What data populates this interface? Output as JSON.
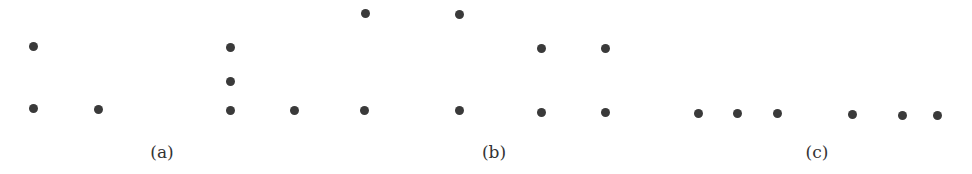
{
  "figure": {
    "dot_color": "#3a3a3a",
    "background": "#ffffff",
    "panels": [
      {
        "id": "a",
        "caption": "(a)",
        "caption_x": 162,
        "groups": [
          {
            "name": "left-configuration",
            "points": [
              [
                33,
                46
              ],
              [
                33,
                108
              ],
              [
                98,
                109
              ]
            ]
          },
          {
            "name": "right-configuration",
            "points": [
              [
                230,
                47
              ],
              [
                230,
                81
              ],
              [
                230,
                110
              ],
              [
                294,
                110
              ]
            ]
          }
        ]
      },
      {
        "id": "b",
        "caption": "(b)",
        "caption_x": 494,
        "groups": [
          {
            "name": "large-square",
            "points": [
              [
                365,
                13
              ],
              [
                459,
                14
              ],
              [
                364,
                110
              ],
              [
                459,
                110
              ]
            ]
          },
          {
            "name": "small-square",
            "points": [
              [
                541,
                48
              ],
              [
                605,
                48
              ],
              [
                541,
                112
              ],
              [
                605,
                112
              ]
            ]
          }
        ]
      },
      {
        "id": "c",
        "caption": "(c)",
        "caption_x": 817,
        "groups": [
          {
            "name": "collinear-points",
            "points": [
              [
                698,
                113
              ],
              [
                737,
                113
              ],
              [
                777,
                113
              ],
              [
                852,
                114
              ],
              [
                902,
                115
              ],
              [
                937,
                115
              ]
            ]
          }
        ]
      }
    ]
  }
}
